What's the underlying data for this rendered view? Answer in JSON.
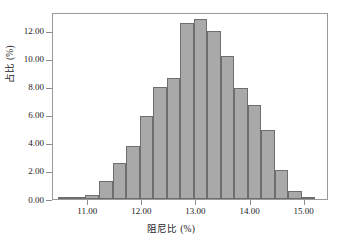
{
  "chart_data": {
    "type": "bar",
    "title": "",
    "subtitle": "",
    "xlabel": "阻尼比 (%)",
    "ylabel": "占比 (%)",
    "xlim": [
      10.35,
      15.45
    ],
    "ylim": [
      0,
      13.35
    ],
    "grid": false,
    "legend": null,
    "bin_width": 0.25,
    "xticks": [
      "11.00",
      "12.00",
      "13.00",
      "14.00",
      "15.00"
    ],
    "xtick_values": [
      11.0,
      12.0,
      13.0,
      14.0,
      15.0
    ],
    "yticks": [
      "0.00",
      "2.00",
      "4.00",
      "6.00",
      "8.00",
      "10.00",
      "12.00"
    ],
    "ytick_values": [
      0,
      2,
      4,
      6,
      8,
      10,
      12
    ],
    "bar_color": "#a9a9a9",
    "bar_edge_color": "#6e6e6e",
    "axis_color": "#9a9a9a",
    "text_color": "#1a1a1a",
    "background": "#ffffff",
    "bin_starts": [
      10.45,
      10.7,
      10.95,
      11.2,
      11.45,
      11.7,
      11.95,
      12.2,
      12.45,
      12.7,
      12.95,
      13.2,
      13.45,
      13.7,
      13.95,
      14.2,
      14.45,
      14.7,
      14.95,
      15.2
    ],
    "categories": [
      "10.45-10.70",
      "10.70-10.95",
      "10.95-11.20",
      "11.20-11.45",
      "11.45-11.70",
      "11.70-11.95",
      "11.95-12.20",
      "12.20-12.45",
      "12.45-12.70",
      "12.70-12.95",
      "12.95-13.20",
      "13.20-13.45",
      "13.45-13.70",
      "13.70-13.95",
      "13.95-14.20",
      "14.20-14.45",
      "14.45-14.70",
      "14.70-14.95",
      "14.95-15.20",
      "15.20-15.45"
    ],
    "values": [
      0.08,
      0.08,
      0.3,
      1.27,
      2.55,
      3.8,
      5.95,
      8.0,
      8.65,
      12.55,
      12.85,
      12.0,
      10.2,
      7.95,
      6.7,
      4.95,
      2.08,
      0.57,
      0.17,
      0.0
    ]
  }
}
